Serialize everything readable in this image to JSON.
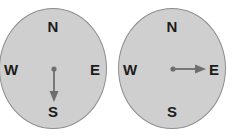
{
  "figure": {
    "title": "",
    "background_color": "#ffffff",
    "dial_fill": "#cfcfcf",
    "dial_stroke": "#8e8e8e",
    "arrow_color": "#6e6e6e",
    "label_color": "#1c1c1c"
  },
  "compasses": [
    {
      "id": "compass-left",
      "labels": {
        "north": "N",
        "south": "S",
        "west": "W",
        "east": "E"
      },
      "needle": {
        "direction": "south",
        "heading_degrees": 180,
        "pivot": {
          "x": 56,
          "y": 61
        },
        "tip": {
          "x": 56,
          "y": 92
        }
      }
    },
    {
      "id": "compass-right",
      "labels": {
        "north": "N",
        "south": "S",
        "west": "W",
        "east": "E"
      },
      "needle": {
        "direction": "east",
        "heading_degrees": 90,
        "pivot": {
          "x": 56,
          "y": 61
        },
        "tip": {
          "x": 90,
          "y": 61
        }
      }
    }
  ]
}
